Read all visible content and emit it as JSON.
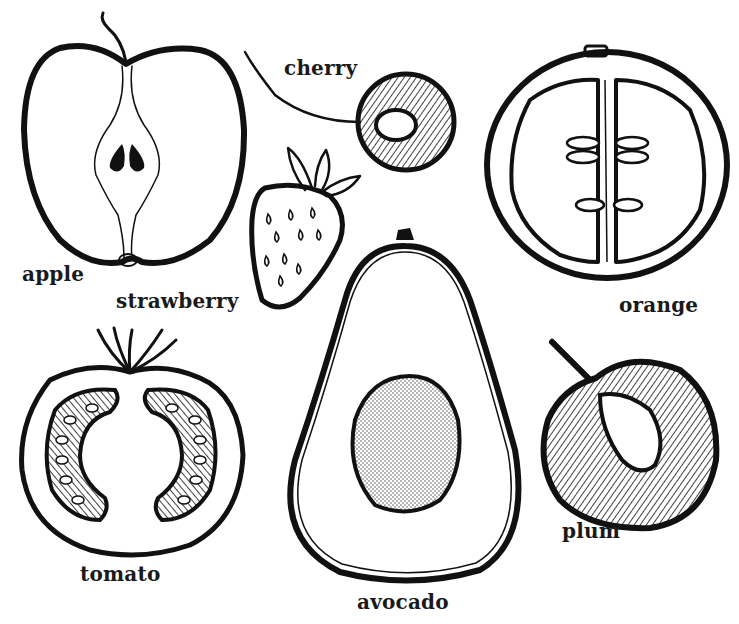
{
  "colors": {
    "ink": "#111111",
    "background": "#ffffff",
    "label": "#1a1a1a"
  },
  "fruits": [
    {
      "id": "apple",
      "label": "apple",
      "label_pos": [
        22,
        262
      ]
    },
    {
      "id": "cherry",
      "label": "cherry",
      "label_pos": [
        284,
        56
      ]
    },
    {
      "id": "strawberry",
      "label": "strawberry",
      "label_pos": [
        116,
        289
      ]
    },
    {
      "id": "orange",
      "label": "orange",
      "label_pos": [
        619,
        293
      ]
    },
    {
      "id": "tomato",
      "label": "tomato",
      "label_pos": [
        80,
        562
      ]
    },
    {
      "id": "avocado",
      "label": "avocado",
      "label_pos": [
        357,
        590
      ]
    },
    {
      "id": "plum",
      "label": "plum",
      "label_pos": [
        562,
        519
      ]
    }
  ]
}
